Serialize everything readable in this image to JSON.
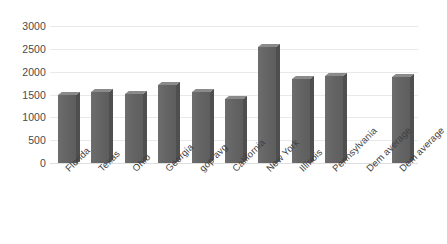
{
  "chart_data": {
    "type": "bar",
    "title": "",
    "subtitle": "",
    "xlabel": "",
    "ylabel": "",
    "ylim": [
      0,
      3000
    ],
    "y_ticks": [
      0,
      500,
      1000,
      1500,
      2000,
      2500,
      3000
    ],
    "y_tick_labels": [
      "0",
      "500",
      "1000",
      "1500",
      "2000",
      "2500",
      "3000"
    ],
    "grid": true,
    "legend": "none",
    "bar_color": "#646464",
    "gridline_color": "#e9e9e9",
    "categories": [
      "Florida",
      "Texas",
      "Ohio",
      "Georgia",
      "gop avg",
      "California",
      "New York",
      "Illinois",
      "Pennsylvania",
      "Dem average",
      "Dem average"
    ],
    "values": [
      1500,
      1560,
      1510,
      1700,
      1550,
      1400,
      2550,
      1850,
      1900,
      null,
      1880
    ],
    "series": [
      {
        "name": "",
        "values": [
          1500,
          1560,
          1510,
          1700,
          1550,
          1400,
          2550,
          1850,
          1900,
          null,
          1880
        ]
      }
    ]
  }
}
